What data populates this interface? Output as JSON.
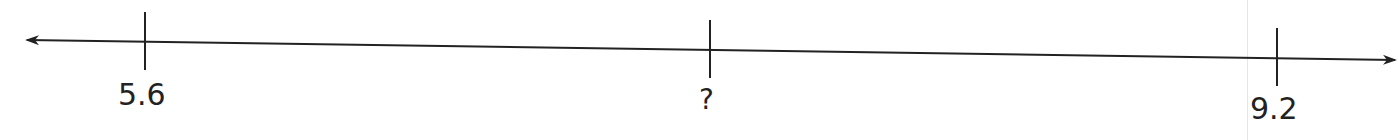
{
  "diagram": {
    "type": "number-line",
    "arrows": "both ends",
    "ticks": [
      {
        "label": "5.6",
        "value": 5.6
      },
      {
        "label": "?",
        "value": null
      },
      {
        "label": "9.2",
        "value": 9.2
      }
    ],
    "colors": {
      "line": "#222222",
      "background": "#ffffff"
    }
  }
}
